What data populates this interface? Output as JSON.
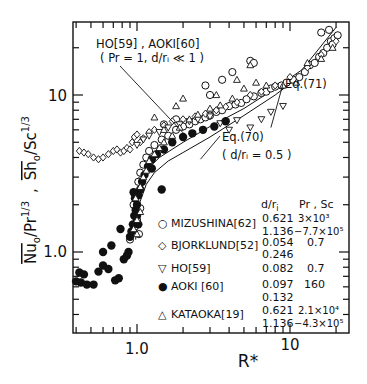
{
  "chart_data": {
    "type": "scatter",
    "title": "",
    "xlabel": "R*",
    "ylabel": "Nu_o/Pr^(1/3) , Sh_o/Sc^(1/3)",
    "ylabel_parts": {
      "nu": "Nu",
      "nu_sub": "o",
      "pr": "/Pr",
      "pr_sup": "1/3",
      "comma": ",",
      "sh": "Sh",
      "sh_sub": "o",
      "sc": "/Sc",
      "sc_sup": "1/3"
    },
    "xscale": "log",
    "yscale": "log",
    "xlim": [
      0.38,
      24
    ],
    "ylim": [
      0.3,
      29
    ],
    "x_ticklabels": [
      {
        "value": 1.0,
        "label": "1.0"
      },
      {
        "value": 10,
        "label": "10"
      }
    ],
    "y_ticklabels": [
      {
        "value": 1.0,
        "label": "1.0"
      },
      {
        "value": 10,
        "label": "10"
      }
    ],
    "grid": false,
    "legend_position": "lower right, inside",
    "legend_header": {
      "col1": "d/r",
      "col1_sub": "i",
      "col2": "Pr , Sc"
    },
    "legend": [
      {
        "symbol": "○",
        "name": "MIZUSHINA[62]",
        "d_ri": [
          "0.621",
          "1.136"
        ],
        "pr_sc": [
          "3×10³",
          "−7.7×10⁵"
        ]
      },
      {
        "symbol": "◇",
        "name": "BJORKLUND[52]",
        "d_ri": [
          "0.054",
          "0.246"
        ],
        "pr_sc": [
          "0.7",
          ""
        ]
      },
      {
        "symbol": "▽",
        "name": "HO[59]",
        "d_ri": [
          "0.082"
        ],
        "pr_sc": [
          "0.7"
        ]
      },
      {
        "symbol": "●",
        "name": "AOKI [60]",
        "d_ri": [
          "0.097",
          "0.132"
        ],
        "pr_sc": [
          "160",
          ""
        ]
      },
      {
        "symbol": "△",
        "name": "KATAOKA[19]",
        "d_ri": [
          "0.621",
          "1.136"
        ],
        "pr_sc": [
          "2.1×10⁴",
          "−4.3×10⁵"
        ]
      }
    ],
    "annotations": [
      {
        "text": "HO[59] , AOKI[60]",
        "line2": "( Pr = 1, d/rᵢ ≪ 1 )",
        "points_to": [
          2.05,
          5.6
        ]
      },
      {
        "text": "Eq.(71)",
        "points_to": [
          7.5,
          6.2
        ]
      },
      {
        "text": "Eq.(70)",
        "line2": "( d/rᵢ = 0.5 )",
        "points_to": [
          2.6,
          3.9
        ]
      }
    ],
    "lines": [
      {
        "name": "Eq.(71)",
        "x": [
          1.0,
          1.4,
          2.0,
          3.0,
          5.0,
          8.0,
          12.0,
          20.0
        ],
        "y": [
          2.9,
          4.0,
          5.0,
          6.3,
          8.2,
          11.0,
          14.5,
          27.0
        ]
      },
      {
        "name": "Eq.(70)",
        "x": [
          0.98,
          1.0,
          1.05,
          1.15,
          1.3,
          1.6,
          2.0,
          3.0,
          5.0,
          8.0,
          12.0,
          20.0
        ],
        "y": [
          1.2,
          1.6,
          2.1,
          2.7,
          3.2,
          3.8,
          4.3,
          5.4,
          7.4,
          10.0,
          13.5,
          24.0
        ]
      }
    ],
    "series": [
      {
        "name": "MIZUSHINA[62]",
        "marker": "circle-open",
        "x": [
          1.02,
          1.05,
          1.1,
          1.15,
          1.2,
          1.3,
          1.45,
          1.6,
          1.8,
          2.0,
          2.2,
          2.4,
          2.6,
          2.8,
          3.0,
          3.3,
          3.6,
          4.0,
          4.4,
          4.8,
          5.2,
          5.8,
          6.5,
          7.0,
          7.5,
          8.0,
          8.8,
          9.5,
          10.5,
          11.5,
          12.5,
          13.5,
          14.5,
          15.5,
          16.5,
          17.5,
          18.5,
          19.5,
          20.5,
          2.8,
          3.0,
          3.6,
          4.2,
          5.5,
          5.8,
          0.9,
          0.97,
          1.0,
          1.03,
          1.05,
          1.8,
          1.5,
          0.95,
          16.0,
          18.0,
          19.0
        ],
        "y": [
          2.8,
          3.2,
          3.6,
          4.0,
          4.4,
          4.8,
          5.2,
          5.5,
          6.0,
          6.3,
          6.5,
          6.8,
          7.0,
          7.2,
          7.4,
          7.8,
          8.0,
          8.5,
          8.7,
          8.9,
          9.4,
          9.8,
          10.3,
          10.5,
          11.0,
          11.3,
          11.5,
          12.0,
          12.5,
          13.0,
          14.0,
          15.5,
          16.0,
          17.5,
          18.5,
          20.0,
          22.0,
          23.0,
          24.0,
          11.5,
          10.0,
          12.5,
          14.0,
          16.5,
          16.0,
          1.2,
          1.45,
          1.6,
          1.3,
          1.9,
          7.0,
          6.5,
          2.0,
          25.0,
          26.0,
          21.0
        ]
      },
      {
        "name": "BJORKLUND[52]",
        "marker": "diamond-open",
        "x": [
          0.42,
          0.45,
          0.48,
          0.52,
          0.56,
          0.6,
          0.65,
          0.7,
          0.74,
          0.78,
          0.82,
          0.86,
          0.9,
          0.93,
          0.96,
          1.0,
          1.05,
          1.1,
          1.2,
          1.3,
          1.5,
          1.7,
          2.0,
          2.4,
          2.8,
          3.3,
          3.8,
          4.5,
          5.5,
          6.5,
          8.0,
          10.0,
          13.0,
          16.0,
          20.0
        ],
        "y": [
          4.4,
          4.3,
          4.2,
          4.0,
          3.9,
          4.0,
          4.2,
          4.4,
          4.5,
          4.3,
          4.4,
          4.6,
          4.5,
          5.0,
          5.4,
          5.6,
          5.0,
          5.3,
          5.8,
          6.0,
          6.4,
          6.8,
          7.0,
          7.3,
          7.6,
          8.0,
          8.4,
          9.0,
          10.0,
          10.5,
          11.5,
          13.0,
          15.0,
          18.0,
          22.0
        ]
      },
      {
        "name": "HO[59]",
        "marker": "triangle-down-open",
        "x": [
          1.0,
          1.1,
          1.2,
          1.4,
          1.6,
          1.9,
          2.2,
          2.5,
          3.0,
          3.5,
          4.0,
          4.5,
          5.5,
          6.5,
          7.5,
          9.0
        ],
        "y": [
          4.8,
          5.2,
          5.5,
          5.8,
          6.2,
          6.5,
          6.8,
          7.0,
          7.3,
          6.6,
          6.0,
          6.9,
          6.2,
          7.0,
          7.8,
          8.5
        ]
      },
      {
        "name": "AOKI [60]",
        "marker": "circle-filled",
        "x": [
          0.39,
          0.42,
          0.45,
          0.4,
          0.43,
          0.47,
          0.52,
          0.56,
          0.6,
          0.65,
          0.72,
          0.76,
          0.82,
          0.86,
          0.88,
          0.9,
          0.92,
          0.94,
          0.96,
          0.98,
          1.0,
          1.02,
          1.05,
          1.08,
          1.12,
          1.18,
          1.25,
          1.35,
          1.5,
          1.7,
          2.0,
          2.3,
          2.7,
          3.2,
          3.8,
          0.6,
          0.68,
          0.95,
          0.97,
          1.0,
          1.02,
          1.25,
          1.45,
          0.78
        ],
        "y": [
          0.72,
          0.74,
          0.72,
          0.65,
          0.64,
          0.62,
          0.62,
          0.75,
          0.82,
          0.78,
          0.66,
          0.68,
          0.9,
          0.95,
          1.0,
          1.25,
          1.35,
          1.5,
          1.7,
          1.85,
          2.0,
          2.3,
          2.5,
          2.8,
          3.1,
          3.5,
          3.9,
          4.2,
          4.5,
          5.0,
          5.4,
          5.7,
          6.0,
          6.3,
          6.8,
          1.0,
          1.1,
          2.4,
          2.2,
          1.7,
          1.5,
          3.4,
          2.5,
          1.4
        ]
      },
      {
        "name": "KATAOKA[19]",
        "marker": "triangle-up-open",
        "x": [
          0.95,
          1.0,
          1.05,
          1.1,
          1.15,
          1.2,
          1.3,
          1.4,
          1.5,
          1.7,
          1.9,
          2.2,
          2.5,
          3.0,
          3.5,
          4.2,
          5.0,
          6.0,
          7.0,
          9.0,
          11.0,
          13.0,
          16.0,
          19.0,
          1.3,
          1.5,
          1.8,
          2.0,
          3.3,
          4.5,
          5.5,
          1.05,
          1.0,
          0.98
        ],
        "y": [
          1.4,
          1.6,
          2.6,
          3.0,
          3.3,
          3.8,
          4.2,
          4.6,
          5.0,
          5.5,
          6.2,
          7.0,
          7.5,
          8.2,
          8.6,
          9.5,
          11.0,
          12.0,
          11.5,
          11.5,
          12.0,
          16.0,
          17.0,
          20.0,
          7.2,
          6.0,
          8.5,
          9.5,
          10.0,
          12.5,
          15.5,
          1.8,
          1.3,
          2.2
        ]
      }
    ]
  }
}
